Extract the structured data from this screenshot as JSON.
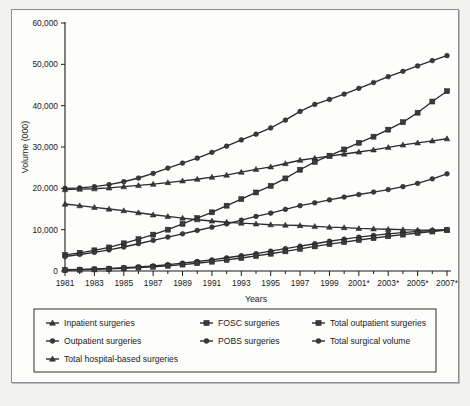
{
  "figure": {
    "background_color": "#f2f2f0",
    "panel_color": "#fdfdfc",
    "border_color": "#8d8d8d",
    "line_color": "#2b2b2b",
    "marker_color": "#3a3a3a"
  },
  "axes": {
    "ylabel": "Volume (000)",
    "xlabel": "Years",
    "ytick_labels": [
      "0",
      "10,000",
      "20,000",
      "30,000",
      "40,000",
      "50,000",
      "60,000"
    ],
    "xtick_labels": [
      "1981",
      "1983",
      "1985",
      "1987",
      "1989",
      "1991",
      "1993",
      "1995",
      "1997",
      "1999",
      "2001*",
      "2003*",
      "2005*",
      "2007*"
    ]
  },
  "legend": {
    "entries": [
      {
        "label": "Inpatient surgeries",
        "marker": "triangle",
        "col": 0,
        "row": 0
      },
      {
        "label": "Outpatient surgeries",
        "marker": "circle",
        "col": 0,
        "row": 1
      },
      {
        "label": "Total hospital-based surgeries",
        "marker": "triangle",
        "col": 0,
        "row": 2
      },
      {
        "label": "FOSC surgeries",
        "marker": "square",
        "col": 1,
        "row": 0
      },
      {
        "label": "POBS surgeries",
        "marker": "circle",
        "col": 1,
        "row": 1
      },
      {
        "label": "Total outpatient surgeries",
        "marker": "square",
        "col": 2,
        "row": 0
      },
      {
        "label": "Total surgical volume",
        "marker": "circle",
        "col": 2,
        "row": 1
      }
    ]
  },
  "chart_data": {
    "type": "line",
    "title": "",
    "xlabel": "Years",
    "ylabel": "Volume (000)",
    "ylim": [
      0,
      60000
    ],
    "ytick_step": 10000,
    "grid": false,
    "legend_position": "below",
    "x": [
      "1981",
      "1982",
      "1983",
      "1984",
      "1985",
      "1986",
      "1987",
      "1988",
      "1989",
      "1990",
      "1991",
      "1992",
      "1993",
      "1994",
      "1995",
      "1996",
      "1997",
      "1998",
      "1999",
      "2000",
      "2001*",
      "2002*",
      "2003*",
      "2004*",
      "2005*",
      "2006*",
      "2007*"
    ],
    "series": [
      {
        "name": "Total surgical volume",
        "marker": "circle",
        "values": [
          20000,
          20100,
          20400,
          20900,
          21600,
          22500,
          23600,
          24900,
          26100,
          27300,
          28700,
          30200,
          31700,
          33100,
          34600,
          36500,
          38600,
          40300,
          41500,
          42800,
          44200,
          45600,
          47000,
          48300,
          49600,
          50900,
          52100
        ]
      },
      {
        "name": "Total hospital-based surgeries",
        "marker": "triangle",
        "values": [
          19700,
          19800,
          19900,
          20100,
          20400,
          20700,
          21000,
          21400,
          21800,
          22200,
          22700,
          23200,
          23900,
          24600,
          25200,
          26000,
          26800,
          27300,
          27800,
          28300,
          28800,
          29300,
          29900,
          30500,
          31000,
          31500,
          32000
        ]
      },
      {
        "name": "Total outpatient surgeries",
        "marker": "square",
        "values": [
          3900,
          4400,
          5000,
          5700,
          6700,
          7700,
          8800,
          10000,
          11400,
          12800,
          14200,
          15800,
          17400,
          19000,
          20600,
          22400,
          24500,
          26400,
          27900,
          29400,
          31000,
          32500,
          34200,
          36000,
          38300,
          41000,
          43500
        ]
      },
      {
        "name": "Inpatient surgeries",
        "marker": "triangle",
        "values": [
          16200,
          15800,
          15400,
          15000,
          14600,
          14100,
          13600,
          13200,
          12800,
          12400,
          12100,
          11800,
          11600,
          11400,
          11200,
          11100,
          11000,
          10800,
          10600,
          10500,
          10300,
          10200,
          10100,
          10000,
          9900,
          9900,
          9900
        ]
      },
      {
        "name": "Outpatient surgeries",
        "marker": "circle",
        "values": [
          3500,
          4000,
          4500,
          5100,
          5800,
          6600,
          7400,
          8200,
          9000,
          9800,
          10600,
          11400,
          12300,
          13200,
          14000,
          14900,
          15800,
          16500,
          17200,
          17900,
          18500,
          19100,
          19700,
          20400,
          21200,
          22300,
          23500
        ]
      },
      {
        "name": "POBS surgeries",
        "marker": "circle",
        "values": [
          300,
          400,
          500,
          650,
          800,
          1000,
          1250,
          1550,
          1900,
          2300,
          2700,
          3200,
          3700,
          4200,
          4800,
          5400,
          6000,
          6600,
          7200,
          7700,
          8200,
          8600,
          9000,
          9300,
          9600,
          9800,
          10000
        ]
      },
      {
        "name": "FOSC surgeries",
        "marker": "square",
        "values": [
          200,
          280,
          380,
          500,
          650,
          820,
          1020,
          1260,
          1550,
          1880,
          2250,
          2680,
          3150,
          3650,
          4180,
          4750,
          5350,
          5950,
          6500,
          7000,
          7500,
          7950,
          8400,
          8800,
          9200,
          9550,
          9900
        ]
      }
    ]
  }
}
